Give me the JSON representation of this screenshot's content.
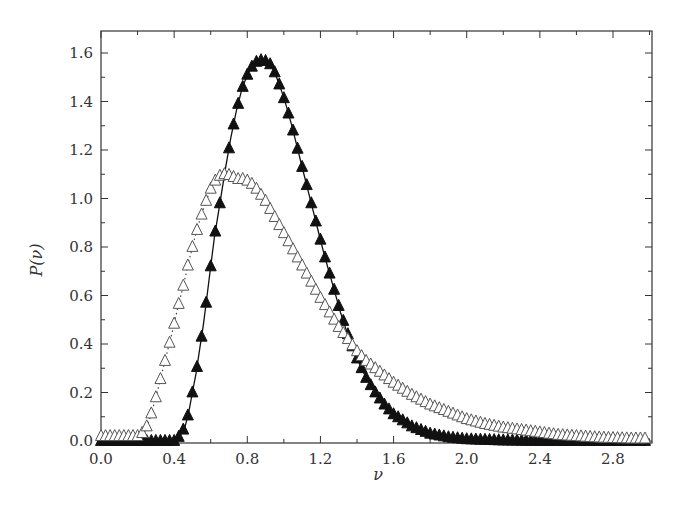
{
  "chart_data": {
    "type": "line",
    "title": "",
    "xlabel": "ν",
    "ylabel": "P(ν)",
    "xlim": [
      0.0,
      3.0
    ],
    "ylim": [
      0.0,
      1.7
    ],
    "xticks": [
      0.0,
      0.4,
      0.8,
      1.2,
      1.6,
      2.0,
      2.4,
      2.8
    ],
    "xtick_labels": [
      "0.0",
      "0.4",
      "0.8",
      "1.2",
      "1.6",
      "2.0",
      "2.4",
      "2.8"
    ],
    "yticks": [
      0.0,
      0.2,
      0.4,
      0.6,
      0.8,
      1.0,
      1.2,
      1.4,
      1.6
    ],
    "ytick_labels": [
      "0.0",
      "0.2",
      "0.4",
      "0.6",
      "0.8",
      "1.0",
      "1.2",
      "1.4",
      "1.6"
    ],
    "grid": false,
    "legend": null,
    "series": [
      {
        "name": "filled triangles (solid line)",
        "marker": "filled-triangle",
        "line": "solid",
        "color": "#111111",
        "x": [
          0.0,
          0.1,
          0.2,
          0.3,
          0.35,
          0.4,
          0.43,
          0.46,
          0.48,
          0.5,
          0.52,
          0.54,
          0.56,
          0.58,
          0.6,
          0.62,
          0.65,
          0.68,
          0.71,
          0.74,
          0.77,
          0.8,
          0.83,
          0.86,
          0.89,
          0.92,
          0.95,
          0.98,
          1.01,
          1.04,
          1.07,
          1.1,
          1.13,
          1.16,
          1.19,
          1.22,
          1.25,
          1.28,
          1.31,
          1.34,
          1.37,
          1.4,
          1.45,
          1.5,
          1.55,
          1.6,
          1.7,
          1.8,
          1.9,
          2.0,
          2.2,
          2.4,
          2.6,
          2.8,
          3.0
        ],
        "y": [
          0.0,
          0.0,
          0.0,
          0.0,
          0.0,
          0.0,
          0.02,
          0.06,
          0.12,
          0.2,
          0.28,
          0.38,
          0.48,
          0.6,
          0.72,
          0.84,
          0.98,
          1.12,
          1.25,
          1.36,
          1.45,
          1.51,
          1.55,
          1.57,
          1.57,
          1.56,
          1.52,
          1.46,
          1.39,
          1.31,
          1.22,
          1.13,
          1.04,
          0.95,
          0.86,
          0.77,
          0.69,
          0.61,
          0.53,
          0.46,
          0.4,
          0.34,
          0.26,
          0.2,
          0.15,
          0.11,
          0.06,
          0.03,
          0.015,
          0.007,
          0.002,
          0.0,
          0.0,
          0.0,
          0.0
        ]
      },
      {
        "name": "open triangles (dotted line)",
        "marker": "open-triangle",
        "line": "dotted",
        "color": "#444444",
        "x": [
          0.0,
          0.05,
          0.1,
          0.15,
          0.2,
          0.24,
          0.27,
          0.3,
          0.33,
          0.36,
          0.39,
          0.42,
          0.45,
          0.48,
          0.51,
          0.54,
          0.57,
          0.6,
          0.63,
          0.66,
          0.69,
          0.72,
          0.75,
          0.78,
          0.81,
          0.84,
          0.87,
          0.9,
          0.93,
          0.96,
          0.99,
          1.02,
          1.05,
          1.08,
          1.11,
          1.14,
          1.17,
          1.2,
          1.25,
          1.3,
          1.35,
          1.4,
          1.45,
          1.5,
          1.6,
          1.7,
          1.8,
          1.9,
          2.0,
          2.1,
          2.2,
          2.3,
          2.4,
          2.5,
          2.6,
          2.7,
          2.8,
          2.9,
          3.0
        ],
        "y": [
          0.02,
          0.02,
          0.02,
          0.02,
          0.02,
          0.04,
          0.1,
          0.18,
          0.27,
          0.36,
          0.45,
          0.55,
          0.64,
          0.74,
          0.83,
          0.91,
          0.98,
          1.04,
          1.08,
          1.1,
          1.1,
          1.09,
          1.08,
          1.08,
          1.07,
          1.05,
          1.02,
          0.99,
          0.95,
          0.91,
          0.87,
          0.83,
          0.79,
          0.75,
          0.71,
          0.67,
          0.63,
          0.59,
          0.53,
          0.47,
          0.42,
          0.37,
          0.33,
          0.3,
          0.24,
          0.19,
          0.15,
          0.12,
          0.09,
          0.07,
          0.055,
          0.045,
          0.035,
          0.025,
          0.02,
          0.015,
          0.012,
          0.01,
          0.01
        ]
      }
    ]
  }
}
